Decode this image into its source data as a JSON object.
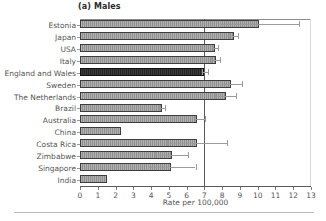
{
  "chart_data": {
    "type": "bar",
    "orientation": "horizontal",
    "title": "(a) Males",
    "xlabel": "Rate per 100,000",
    "ylabel": "",
    "xlim": [
      0,
      13
    ],
    "xticks": [
      0,
      1,
      2,
      3,
      4,
      5,
      6,
      7,
      8,
      9,
      10,
      11,
      12,
      13
    ],
    "xticklabels": [
      "0",
      "1",
      "2",
      "3",
      "4",
      "5",
      "6",
      "7",
      "8",
      "9",
      "10",
      "11",
      "12",
      "13"
    ],
    "grid": false,
    "legend": null,
    "reference_line": 7,
    "highlight_category": "England and Wales",
    "colors": {
      "bar_fill": "#8f8f8f",
      "bar_edge": "#3d3d3d",
      "highlight_fill": "#262626",
      "error_bar": "#9b9b9b",
      "axis": "#5a5a5a",
      "text": "#555555",
      "background": "#ffffff"
    },
    "categories": [
      "Estonia",
      "Japan",
      "USA",
      "Italy",
      "England and Wales",
      "Sweden",
      "The Netherlands",
      "Brazil",
      "Australia",
      "China",
      "Costa Rica",
      "Zimbabwe",
      "Singapore",
      "India"
    ],
    "values": [
      10.1,
      8.65,
      7.6,
      7.65,
      7.0,
      8.5,
      8.2,
      4.6,
      6.6,
      2.3,
      6.6,
      5.15,
      5.1,
      1.5
    ],
    "error_low": [
      7.9,
      8.4,
      7.5,
      7.4,
      6.85,
      7.9,
      7.6,
      4.45,
      6.45,
      null,
      4.9,
      4.2,
      3.8,
      null
    ],
    "error_high": [
      12.3,
      8.9,
      7.75,
      7.9,
      7.2,
      9.1,
      8.8,
      4.8,
      7.05,
      null,
      8.3,
      6.1,
      6.5,
      null
    ]
  }
}
